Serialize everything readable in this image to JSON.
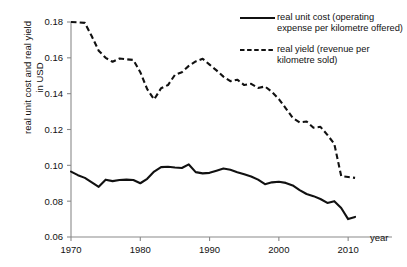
{
  "chart_data": {
    "type": "line",
    "title": "",
    "xlabel": "year",
    "ylabel": "real unit cost and real yield in USD",
    "xlim": [
      1970,
      2012
    ],
    "ylim": [
      0.06,
      0.18
    ],
    "xticks": [
      1970,
      1980,
      1990,
      2000,
      2010
    ],
    "xtick_labels": [
      "1970",
      "1980",
      "1990",
      "2000",
      "2010"
    ],
    "yticks": [
      0.06,
      0.08,
      0.1,
      0.12,
      0.14,
      0.16,
      0.18
    ],
    "ytick_labels": [
      "0.06",
      "0.08",
      "0.10",
      "0.12",
      "0.14",
      "0.16",
      "0.18"
    ],
    "grid": false,
    "legend_position": "top-right",
    "x": [
      1970,
      1971,
      1972,
      1973,
      1974,
      1975,
      1976,
      1977,
      1978,
      1979,
      1980,
      1981,
      1982,
      1983,
      1984,
      1985,
      1986,
      1987,
      1988,
      1989,
      1990,
      1991,
      1992,
      1993,
      1994,
      1995,
      1996,
      1997,
      1998,
      1999,
      2000,
      2001,
      2002,
      2003,
      2004,
      2005,
      2006,
      2007,
      2008,
      2009,
      2010,
      2011
    ],
    "series": [
      {
        "name": "real unit cost (operating expense per kilometre offered)",
        "style": "solid",
        "color": "#111111",
        "values": [
          0.0965,
          0.0945,
          0.093,
          0.0905,
          0.088,
          0.092,
          0.0912,
          0.0918,
          0.092,
          0.0918,
          0.09,
          0.0925,
          0.0965,
          0.099,
          0.0992,
          0.0988,
          0.0985,
          0.1005,
          0.0962,
          0.0955,
          0.0958,
          0.097,
          0.0982,
          0.0975,
          0.0962,
          0.095,
          0.0938,
          0.092,
          0.0895,
          0.0905,
          0.0908,
          0.0902,
          0.0888,
          0.0862,
          0.084,
          0.0828,
          0.0812,
          0.079,
          0.08,
          0.0762,
          0.07,
          0.0712
        ]
      },
      {
        "name": "real yield (revenue per kilometre sold)",
        "style": "dashed",
        "color": "#111111",
        "values": [
          0.18,
          0.1798,
          0.1795,
          0.172,
          0.164,
          0.16,
          0.1578,
          0.1596,
          0.1592,
          0.1588,
          0.152,
          0.1425,
          0.1368,
          0.143,
          0.1448,
          0.1505,
          0.152,
          0.1555,
          0.158,
          0.1595,
          0.1562,
          0.153,
          0.1495,
          0.147,
          0.1478,
          0.1448,
          0.1455,
          0.1432,
          0.144,
          0.141,
          0.137,
          0.1318,
          0.1265,
          0.124,
          0.1245,
          0.121,
          0.1215,
          0.117,
          0.112,
          0.094,
          0.0935,
          0.093
        ]
      }
    ]
  },
  "legend": {
    "items": [
      {
        "label": "real unit cost (operating expense per kilometre offered)",
        "style": "solid"
      },
      {
        "label": "real yield (revenue per kilometre sold)",
        "style": "dashed"
      }
    ]
  },
  "axes": {
    "y_title": "real unit cost and real yield\nin USD",
    "x_title": "year"
  }
}
